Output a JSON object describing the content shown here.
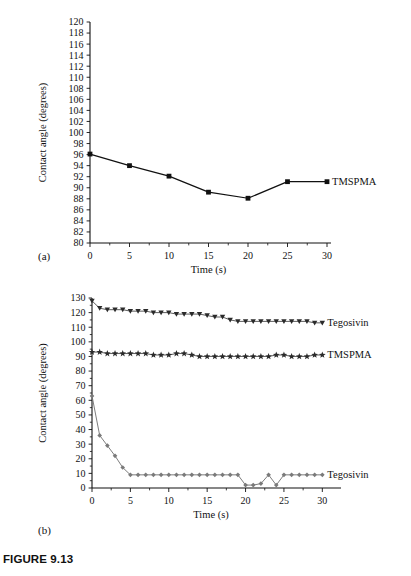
{
  "figure": {
    "caption": "FIGURE 9.13",
    "panel_a_label": "(a)",
    "panel_b_label": "(b)"
  },
  "chart_data": [
    {
      "id": "panel-a",
      "type": "line",
      "title": "",
      "xlabel": "Time (s)",
      "ylabel": "Contact angle (degrees)",
      "xlim": [
        0,
        30
      ],
      "ylim": [
        80,
        120
      ],
      "xticks": [
        0,
        5,
        10,
        15,
        20,
        25,
        30
      ],
      "xtick_labels": [
        "0",
        "5",
        "10",
        "15",
        "20",
        "25",
        "30"
      ],
      "yticks": [
        80,
        82,
        84,
        86,
        88,
        90,
        92,
        94,
        96,
        98,
        100,
        102,
        104,
        106,
        108,
        110,
        112,
        114,
        116,
        118,
        120
      ],
      "ytick_labels": [
        "80",
        "82",
        "84",
        "86",
        "88",
        "90",
        "92",
        "94",
        "96",
        "98",
        "100",
        "102",
        "104",
        "106",
        "108",
        "110",
        "112",
        "114",
        "116",
        "118",
        "120"
      ],
      "grid": false,
      "legend_position": "right-inline",
      "series": [
        {
          "name": "TMSPMA",
          "marker": "square",
          "color": "#111111",
          "label_position": "right",
          "x": [
            0,
            5,
            10,
            15,
            20,
            25,
            30
          ],
          "values": [
            96.1,
            94.0,
            92.1,
            89.2,
            88.1,
            91.1,
            91.1
          ]
        }
      ]
    },
    {
      "id": "panel-b",
      "type": "line",
      "title": "",
      "xlabel": "Time (s)",
      "ylabel": "Contact angle (degrees)",
      "xlim": [
        0,
        31
      ],
      "ylim": [
        0,
        130
      ],
      "xticks": [
        0,
        5,
        10,
        15,
        20,
        25,
        30
      ],
      "xtick_labels": [
        "0",
        "5",
        "10",
        "15",
        "20",
        "25",
        "30"
      ],
      "yticks": [
        0,
        10,
        20,
        30,
        40,
        50,
        60,
        70,
        80,
        90,
        100,
        110,
        120,
        130
      ],
      "ytick_labels": [
        "0",
        "10",
        "20",
        "30",
        "40",
        "50",
        "60",
        "70",
        "80",
        "90",
        "100",
        "110",
        "120",
        "130"
      ],
      "grid": false,
      "legend_position": "right-inline",
      "series": [
        {
          "name": "Tegosivin",
          "marker": "triangle-down",
          "color": "#2a2a2a",
          "label_position": "right",
          "x": [
            0,
            1,
            2,
            3,
            4,
            5,
            6,
            7,
            8,
            9,
            10,
            11,
            12,
            13,
            14,
            15,
            16,
            17,
            18,
            19,
            20,
            21,
            22,
            23,
            24,
            25,
            26,
            27,
            28,
            29,
            30
          ],
          "values": [
            128,
            123,
            122,
            122,
            122,
            121,
            121,
            121,
            120,
            120,
            120,
            119,
            119,
            119,
            119,
            118,
            117,
            117,
            115,
            114,
            114,
            114,
            114,
            114,
            114,
            114,
            114,
            114,
            114,
            113,
            113
          ]
        },
        {
          "name": "TMSPMA",
          "marker": "star",
          "color": "#2a2a2a",
          "label_position": "right",
          "x": [
            0,
            1,
            2,
            3,
            4,
            5,
            6,
            7,
            8,
            9,
            10,
            11,
            12,
            13,
            14,
            15,
            16,
            17,
            18,
            19,
            20,
            21,
            22,
            23,
            24,
            25,
            26,
            27,
            28,
            29,
            30
          ],
          "values": [
            93,
            93,
            92,
            92,
            92,
            92,
            92,
            92,
            91,
            91,
            91,
            92,
            92,
            91,
            90,
            90,
            90,
            90,
            90,
            90,
            90,
            90,
            90,
            90,
            91,
            91,
            90,
            90,
            90,
            91,
            91
          ]
        },
        {
          "name": "Tegosivin",
          "marker": "diamond",
          "color": "#7a7a7a",
          "label_position": "right",
          "x": [
            0,
            1,
            2,
            3,
            4,
            5,
            6,
            7,
            8,
            9,
            10,
            11,
            12,
            13,
            14,
            15,
            16,
            17,
            18,
            19,
            20,
            21,
            22,
            23,
            24,
            25,
            26,
            27,
            28,
            29,
            30
          ],
          "values": [
            63,
            36,
            29,
            22,
            14,
            9,
            9,
            9,
            9,
            9,
            9,
            9,
            9,
            9,
            9,
            9,
            9,
            9,
            9,
            9,
            2,
            2,
            3,
            9,
            2,
            9,
            9,
            9,
            9,
            9,
            9
          ]
        }
      ]
    }
  ]
}
